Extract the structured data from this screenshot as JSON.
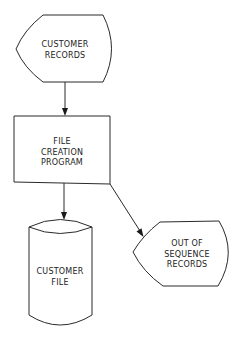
{
  "diagram": {
    "type": "flowchart",
    "colors": {
      "stroke": "#2a2a2a",
      "fill": "#ffffff",
      "text": "#222222"
    },
    "nodes": [
      {
        "id": "customer-records",
        "shape": "display",
        "lines": [
          "CUSTOMER",
          "RECORDS"
        ]
      },
      {
        "id": "file-creation-program",
        "shape": "process",
        "lines": [
          "FILE",
          "CREATION",
          "PROGRAM"
        ]
      },
      {
        "id": "customer-file",
        "shape": "magnetic-disk",
        "lines": [
          "CUSTOMER",
          "FILE"
        ]
      },
      {
        "id": "out-of-sequence-records",
        "shape": "display",
        "lines": [
          "OUT  OF",
          "SEQUENCE",
          "RECORDS"
        ]
      }
    ],
    "edges": [
      {
        "from": "customer-records",
        "to": "file-creation-program"
      },
      {
        "from": "file-creation-program",
        "to": "customer-file"
      },
      {
        "from": "file-creation-program",
        "to": "out-of-sequence-records"
      }
    ]
  }
}
